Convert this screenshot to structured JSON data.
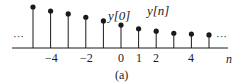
{
  "chart_data": {
    "type": "stem",
    "title": "",
    "caption": "(a)",
    "xlabel": "n",
    "ylabel": "",
    "x": [
      -5,
      -4,
      -3,
      -2,
      -1,
      0,
      1,
      2,
      3,
      4,
      5
    ],
    "values": [
      1.0,
      0.9,
      0.83,
      0.75,
      0.66,
      0.56,
      0.47,
      0.41,
      0.36,
      0.34,
      0.32
    ],
    "tick_labels": [
      "-4",
      "-2",
      "0",
      "1",
      "2",
      "4"
    ],
    "tick_positions": [
      -4,
      -2,
      0,
      1,
      2,
      4
    ],
    "annotations": [
      "y[0]",
      "y[n]"
    ],
    "ellipsis_left": "...",
    "ellipsis_right": "...",
    "grid": false
  },
  "labels": {
    "y0": "y[0]",
    "yn": "y[n]",
    "n": "n",
    "caption": "(a)",
    "dots_left": "···",
    "dots_right": "···",
    "ticks": [
      "−4",
      "−2",
      "0",
      "1",
      "2",
      "4"
    ]
  },
  "colors": {
    "stem": "#1a1a1a",
    "axis": "#1a1a1a"
  }
}
